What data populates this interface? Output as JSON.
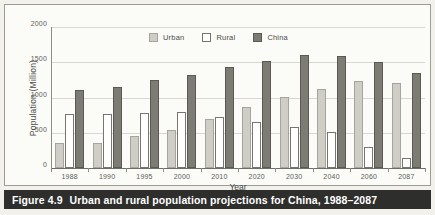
{
  "figure": {
    "caption_number": "Figure 4.9",
    "caption_text": "Urban and rural population projections for China, 1988–2087"
  },
  "colors": {
    "urban": "#cfcec6",
    "rural": "#ffffff",
    "china": "#7c7b74",
    "caption_bar": "#2e2e2c",
    "grid": "#d8d7d0",
    "axis": "#8c8c85",
    "plot_bg": "#fbfbf8",
    "page_bg": "#f2f1ec"
  },
  "chart_data": {
    "type": "bar",
    "title": "",
    "xlabel": "Year",
    "ylabel": "Population (Million)",
    "ylim": [
      0,
      2000
    ],
    "yticks": [
      2000,
      1500,
      1000,
      500,
      0
    ],
    "grid": true,
    "legend_position": "top-center",
    "categories": [
      "1988",
      "1990",
      "1995",
      "2000",
      "2010",
      "2020",
      "2030",
      "2040",
      "2060",
      "2087"
    ],
    "series": [
      {
        "name": "Urban",
        "values": [
          355,
          360,
          455,
          540,
          700,
          870,
          1005,
          1125,
          1230,
          1200
        ]
      },
      {
        "name": "Rural",
        "values": [
          770,
          760,
          775,
          795,
          730,
          655,
          580,
          505,
          300,
          135
        ]
      },
      {
        "name": "China",
        "values": [
          1110,
          1150,
          1245,
          1320,
          1430,
          1520,
          1600,
          1590,
          1510,
          1345
        ]
      }
    ]
  }
}
